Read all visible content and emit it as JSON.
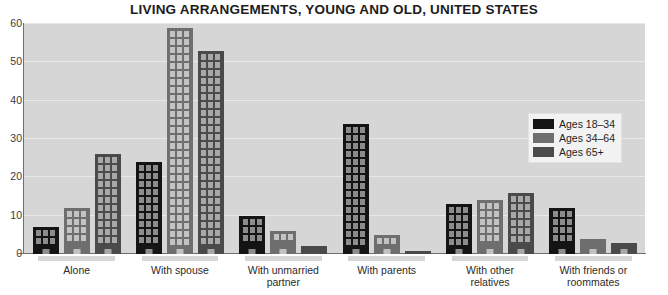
{
  "chart_data": {
    "type": "bar",
    "title": "LIVING ARRANGEMENTS, YOUNG AND OLD, UNITED STATES",
    "xlabel": "",
    "ylabel": "",
    "ylim": [
      0,
      60
    ],
    "yticks": [
      0,
      10,
      20,
      30,
      40,
      50,
      60
    ],
    "grid": true,
    "legend_position": "right",
    "categories": [
      "Alone",
      "With spouse",
      "With unmarried\npartner",
      "With parents",
      "With other\nrelatives",
      "With friends or\nroommates"
    ],
    "series": [
      {
        "name": "Ages 18–34",
        "color": "#141414",
        "values": [
          7,
          24,
          10,
          34,
          13,
          12
        ],
        "labels": [
          "7%",
          "24%",
          "10%",
          "34%",
          "13%",
          "12%"
        ]
      },
      {
        "name": "Ages 34–64",
        "color": "#6e6e6e",
        "values": [
          12,
          59,
          6,
          5,
          14,
          4
        ],
        "labels": [
          "12%",
          "59%",
          "6%",
          "5%",
          "14%",
          "4%"
        ]
      },
      {
        "name": "Ages 65+",
        "color": "#4a4a4a",
        "values": [
          26,
          53,
          2,
          0,
          16,
          3
        ],
        "labels": [
          "26%",
          "53%",
          "2%",
          "0%",
          "16%",
          "3%"
        ]
      }
    ]
  },
  "source_note": "DATA FROM U.S. CENSUS BUREAU, 2016A",
  "colors": {
    "plot_background": "#d6d6d6",
    "gridline": "#e9e9e9",
    "axis": "#6f6f6f",
    "page_background": "#ffffff"
  }
}
